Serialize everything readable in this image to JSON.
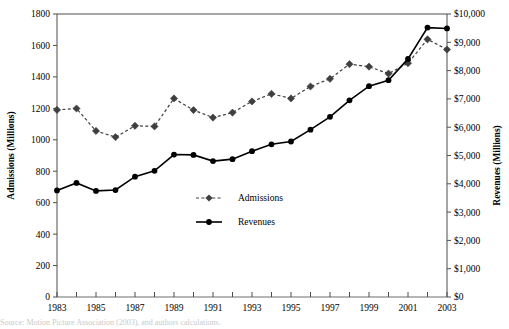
{
  "chart_data": {
    "type": "line",
    "title": "",
    "xlabel": "",
    "ylabel": "Admissions (Millions)",
    "y2label": "Revenues (Millions)",
    "x": [
      1983,
      1984,
      1985,
      1986,
      1987,
      1988,
      1989,
      1990,
      1991,
      1992,
      1993,
      1994,
      1995,
      1996,
      1997,
      1998,
      1999,
      2000,
      2001,
      2002,
      2003
    ],
    "xtick_labels": [
      "1983",
      "1985",
      "1987",
      "1989",
      "1991",
      "1993",
      "1995",
      "1997",
      "1999",
      "2001",
      "2003"
    ],
    "xlim": [
      1983,
      2003
    ],
    "ylim": [
      0,
      1800
    ],
    "ytick_labels": [
      "0",
      "200",
      "400",
      "600",
      "800",
      "1000",
      "1200",
      "1400",
      "1600",
      "1800"
    ],
    "ytick_values": [
      0,
      200,
      400,
      600,
      800,
      1000,
      1200,
      1400,
      1600,
      1800
    ],
    "y2lim": [
      0,
      10000
    ],
    "y2tick_labels": [
      "$0",
      "$1,000",
      "$2,000",
      "$3,000",
      "$4,000",
      "$5,000",
      "$6,000",
      "$7,000",
      "$8,000",
      "$9,000",
      "$10,000"
    ],
    "y2tick_values": [
      0,
      1000,
      2000,
      3000,
      4000,
      5000,
      6000,
      7000,
      8000,
      9000,
      10000
    ],
    "grid": false,
    "legend_position": "center",
    "series": [
      {
        "name": "Admissions",
        "axis": "left",
        "marker": "diamond",
        "linestyle": "dashed",
        "color": "#3f3f3f",
        "values": [
          1190,
          1199,
          1056,
          1017,
          1089,
          1085,
          1263,
          1189,
          1141,
          1173,
          1244,
          1292,
          1263,
          1339,
          1388,
          1481,
          1465,
          1421,
          1487,
          1639,
          1574
        ]
      },
      {
        "name": "Revenues",
        "axis": "right",
        "marker": "circle",
        "linestyle": "solid",
        "color": "#000000",
        "values": [
          3766,
          4031,
          3749,
          3780,
          4253,
          4458,
          5033,
          5022,
          4803,
          4871,
          5154,
          5396,
          5494,
          5912,
          6366,
          6949,
          7448,
          7661,
          8413,
          9520,
          9489
        ]
      }
    ]
  },
  "legend": {
    "items": [
      {
        "label": "Admissions"
      },
      {
        "label": "Revenues"
      }
    ]
  },
  "caption": {
    "text": "Source: Motion Picture Association (2003), and authors calculations."
  }
}
